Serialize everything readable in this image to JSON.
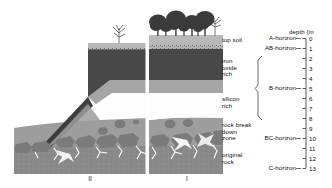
{
  "figure": {
    "type": "soil-profile-cross-section-diagram",
    "axis": {
      "title": "depth (m",
      "ticks": [
        {
          "value": "0",
          "y": 38.5
        },
        {
          "value": "1",
          "y": 48.5
        },
        {
          "value": "2",
          "y": 58.5
        },
        {
          "value": "3",
          "y": 68.5
        },
        {
          "value": "4",
          "y": 78.5
        },
        {
          "value": "5",
          "y": 88.5
        },
        {
          "value": "6",
          "y": 98.5
        },
        {
          "value": "7",
          "y": 108.5
        },
        {
          "value": "8",
          "y": 118.5
        },
        {
          "value": "9",
          "y": 128.5
        },
        {
          "value": "10",
          "y": 138.5
        },
        {
          "value": "11",
          "y": 148.5
        },
        {
          "value": "12",
          "y": 158.5
        },
        {
          "value": "13",
          "y": 168.5
        }
      ],
      "range": [
        0,
        13
      ],
      "unit": "m"
    },
    "horizons": [
      {
        "name": "A-horizon",
        "label_y": 36.0,
        "bracket": false
      },
      {
        "name": "AB-horizon",
        "label_y": 46.5,
        "bracket": false
      },
      {
        "name": "B-horizon",
        "label_y": 87.0,
        "bracket": true,
        "bracket_top": 56.0,
        "bracket_bottom": 120.0
      },
      {
        "name": "BC-horizon",
        "label_y": 137.0,
        "bracket": false
      },
      {
        "name": "C-horizon",
        "label_y": 164.0,
        "bracket": false
      }
    ],
    "layers": [
      {
        "name": "top soil",
        "label": "top soil",
        "label_y": 40.0,
        "color": "#b9b9b9"
      },
      {
        "name": "iron-oxide-rich",
        "label": "iron\noxide\nrich",
        "label_y": 62.0,
        "color": "#4a4a4a"
      },
      {
        "name": "silicon-rich",
        "label": "silicon\nrich",
        "label_y": 99.0,
        "color": "#ffffff"
      },
      {
        "name": "rock-break-down-zone",
        "label": "rock break\ndown\nzone",
        "label_y": 125.0,
        "color": "#9a9a9a"
      },
      {
        "name": "original-rock",
        "label": "original\nrock",
        "label_y": 155.0,
        "color": "#8c8c8c"
      }
    ],
    "profiles": [
      {
        "name": "II",
        "label": "II",
        "x": 90
      },
      {
        "name": "I",
        "label": "I",
        "x": 187
      }
    ],
    "colors": {
      "top_soil": "#b9b9b9",
      "transition_speckle": "#8e8e8e",
      "iron_oxide": "#484848",
      "iron_oxide_lower": "#6d6d6d",
      "silicon_rich": "#fdfdfd",
      "breakdown_matrix": "#9d9d9d",
      "rock_clast": "#7b7b7b",
      "original_rock": "#8a8a8a",
      "fracture": "#ffffff",
      "slope_dark": "#3d3d3d",
      "tree_canopy": "#3a3a3a",
      "column_divider": "#ffffff",
      "axis_line": "#4a4a4a",
      "text": "#111111"
    }
  }
}
